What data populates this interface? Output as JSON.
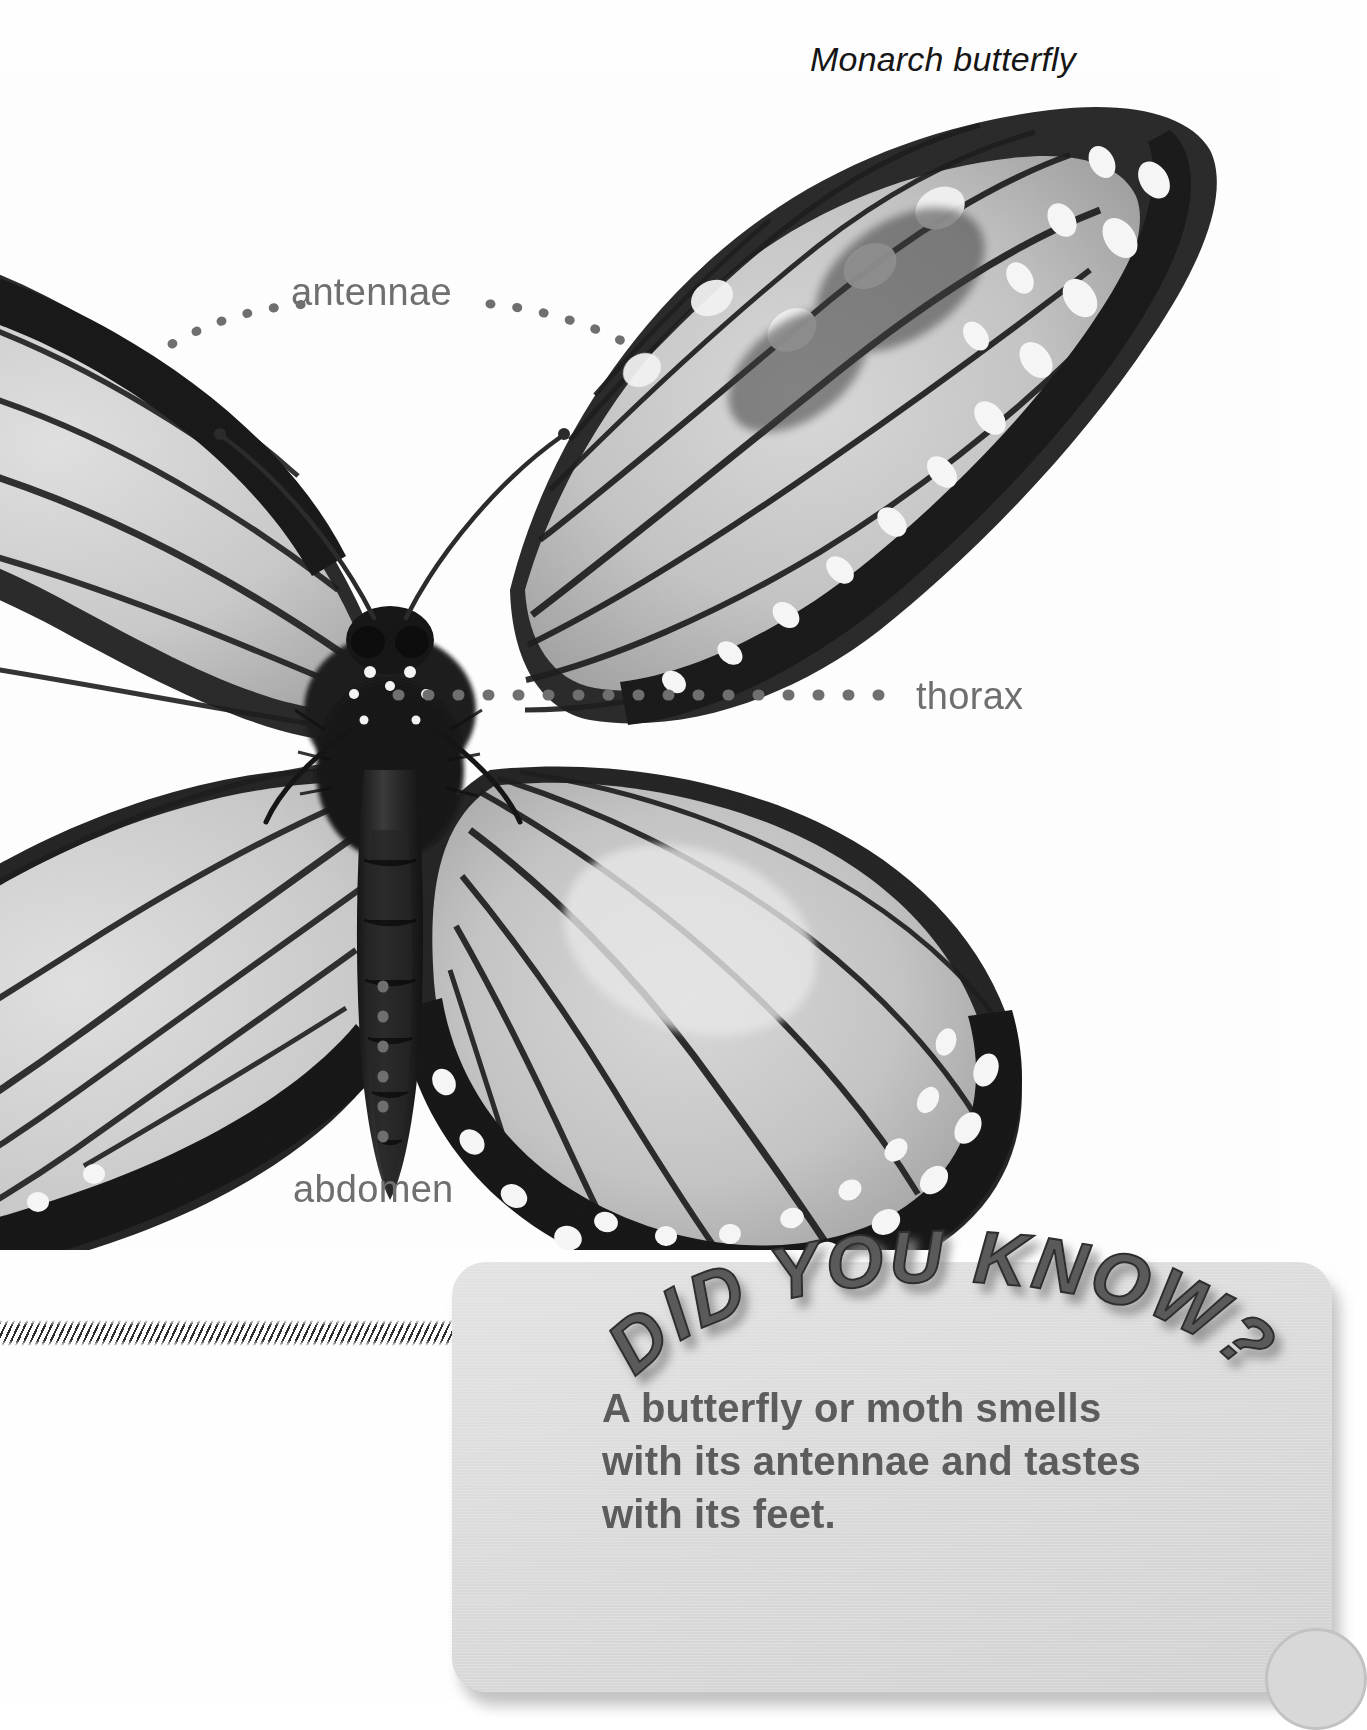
{
  "page": {
    "background_color": "#ffffff",
    "caption": "Monarch butterfly"
  },
  "photo": {
    "subject": "monarch-butterfly-specimen",
    "description": "Grayscale photograph of a monarch butterfly with wings spread"
  },
  "labels": [
    {
      "id": "antennae",
      "text": "antennae",
      "color": "#6f6f6f"
    },
    {
      "id": "thorax",
      "text": "thorax",
      "color": "#6f6f6f"
    },
    {
      "id": "abdomen",
      "text": "abdomen",
      "color": "#6f6f6f"
    }
  ],
  "did_you_know": {
    "title": "DID YOU KNOW?",
    "title_color": "#5a5a5a",
    "box_color": "#dcdcdc",
    "body_lines": [
      "A butterfly or moth smells",
      "with its antennae and tastes",
      "with its feet."
    ],
    "body_text": "A butterfly or moth smells with its antennae and tastes with its feet."
  }
}
